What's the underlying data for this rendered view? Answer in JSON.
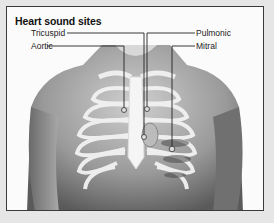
{
  "figure": {
    "title": "Heart sound sites",
    "labels": {
      "tricuspid": "Tricuspid",
      "aortic": "Aortic",
      "pulmonic": "Pulmonic",
      "mitral": "Mitral"
    },
    "image_description": "Anterior view of a male torso with rib cage overlay, showing auscultation points for heart sounds"
  }
}
